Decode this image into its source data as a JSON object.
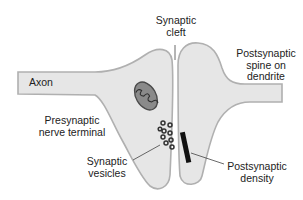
{
  "diagram": {
    "colors": {
      "background": "#ffffff",
      "cell_fill": "#e6e6e6",
      "membrane": "#b0b0b0",
      "mitochondrion_fill": "#8a8a8a",
      "mitochondrion_outline": "#4a4a4a",
      "vesicle": "#333333",
      "density": "#111111",
      "leader_line": "#444444",
      "text": "#222222"
    },
    "labels": {
      "axon": "Axon",
      "synaptic_cleft": "Synaptic\ncleft",
      "postsynaptic_spine": "Postsynaptic\nspine on\ndendrite",
      "presynaptic_terminal": "Presynaptic\nnerve terminal",
      "synaptic_vesicles": "Synaptic\nvesicles",
      "postsynaptic_density": "Postsynaptic\ndensity"
    },
    "vesicle_count": 9
  }
}
